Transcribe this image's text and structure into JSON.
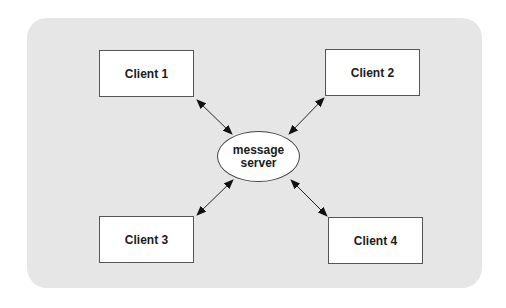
{
  "diagram": {
    "background_color": "#e6e6e6",
    "server": {
      "label_line1": "message",
      "label_line2": "server"
    },
    "clients": [
      {
        "label": "Client 1"
      },
      {
        "label": "Client 2"
      },
      {
        "label": "Client 3"
      },
      {
        "label": "Client 4"
      }
    ],
    "connections": [
      {
        "from": "Client 1",
        "to": "message server",
        "type": "bidirectional-arrow"
      },
      {
        "from": "Client 2",
        "to": "message server",
        "type": "bidirectional-arrow"
      },
      {
        "from": "Client 3",
        "to": "message server",
        "type": "bidirectional-arrow"
      },
      {
        "from": "Client 4",
        "to": "message server",
        "type": "bidirectional-arrow"
      }
    ]
  }
}
